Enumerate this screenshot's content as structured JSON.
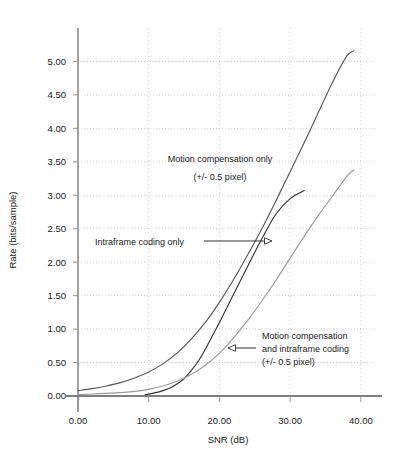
{
  "chart_data": {
    "type": "line",
    "title": "",
    "xlabel": "SNR (dB)",
    "ylabel": "Rate (bits/sample)",
    "xlim": [
      0.0,
      42.0
    ],
    "ylim": [
      0.0,
      5.5
    ],
    "xticks": [
      "0.00",
      "10.00",
      "20.00",
      "30.00",
      "40.00"
    ],
    "xtick_values": [
      0,
      10,
      20,
      30,
      40
    ],
    "yticks": [
      "0.00",
      "0.50",
      "1.00",
      "1.50",
      "2.00",
      "2.50",
      "3.00",
      "3.50",
      "4.00",
      "4.50",
      "5.00"
    ],
    "ytick_values": [
      0.0,
      0.5,
      1.0,
      1.5,
      2.0,
      2.5,
      3.0,
      3.5,
      4.0,
      4.5,
      5.0
    ],
    "grid": "dotted-both",
    "legend_position": "inline-annotations",
    "series": [
      {
        "name": "Motion compensation only (+/- 0.5 pixel)",
        "color": "#595959",
        "x": [
          0,
          2,
          4,
          6,
          8,
          10,
          12,
          14,
          16,
          18,
          20,
          22,
          24,
          26,
          28,
          30,
          32,
          34,
          36,
          38,
          39
        ],
        "values": [
          0.08,
          0.11,
          0.15,
          0.2,
          0.27,
          0.36,
          0.48,
          0.64,
          0.85,
          1.1,
          1.4,
          1.74,
          2.11,
          2.5,
          2.92,
          3.35,
          3.79,
          4.24,
          4.69,
          5.08,
          5.16
        ]
      },
      {
        "name": "Intraframe coding only",
        "color": "#333333",
        "x": [
          9.5,
          11,
          12,
          13,
          14,
          15,
          16,
          17,
          18,
          19,
          20,
          22,
          24,
          26,
          28,
          30,
          32
        ],
        "values": [
          0.02,
          0.05,
          0.08,
          0.12,
          0.18,
          0.26,
          0.38,
          0.52,
          0.7,
          0.9,
          1.1,
          1.52,
          1.94,
          2.35,
          2.72,
          2.95,
          3.07
        ]
      },
      {
        "name": "Motion compensation and intraframe coding (+/- 0.5 pixel)",
        "color": "#9a9a9a",
        "x": [
          0,
          2,
          4,
          6,
          8,
          10,
          12,
          14,
          16,
          18,
          20,
          22,
          24,
          26,
          28,
          30,
          32,
          34,
          36,
          38,
          39
        ],
        "values": [
          0.02,
          0.03,
          0.04,
          0.05,
          0.07,
          0.1,
          0.15,
          0.22,
          0.32,
          0.46,
          0.64,
          0.87,
          1.13,
          1.42,
          1.73,
          2.06,
          2.39,
          2.7,
          2.99,
          3.28,
          3.38
        ]
      }
    ],
    "annotations": [
      {
        "name": "motion-compensation-only",
        "lines": [
          "Motion compensation only",
          "(+/- 0.5 pixel)"
        ]
      },
      {
        "name": "intraframe-coding-only",
        "lines": [
          "Intraframe coding only"
        ],
        "arrow": "right"
      },
      {
        "name": "motion-compensation-and-intraframe",
        "lines": [
          "Motion compensation",
          "and intraframe coding",
          "(+/- 0.5 pixel)"
        ],
        "arrow": "left"
      }
    ]
  }
}
